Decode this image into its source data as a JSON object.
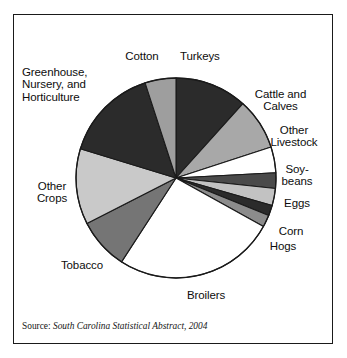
{
  "figure": {
    "source_label": "Source:",
    "source_title": "South Carolina Statistical Abstract, 2004"
  },
  "chart_data": {
    "type": "pie",
    "title": "",
    "subtitle": "",
    "xlabel": "",
    "ylabel": "",
    "legend_position": "none",
    "labels_position": "outside-callout",
    "grid": false,
    "start_angle_deg": 0,
    "direction": "clockwise",
    "categories": [
      "Turkeys",
      "Cattle and Calves",
      "Other Livestock",
      "Soybeans",
      "Eggs",
      "Corn",
      "Hogs",
      "Broilers",
      "Tobacco",
      "Other Crops",
      "Greenhouse, Nursery, and Horticulture",
      "Cotton"
    ],
    "values": [
      11.7,
      8.3,
      4.2,
      2.5,
      2.8,
      1.7,
      1.9,
      26.1,
      8.3,
      12.2,
      15.3,
      5.0
    ],
    "units": "percent of total agricultural receipts",
    "slices": [
      {
        "label": "Turkeys",
        "value": 11.7,
        "start_deg": 0,
        "end_deg": 42,
        "color": "#2b2b2b"
      },
      {
        "label": "Cattle and Calves",
        "value": 8.3,
        "start_deg": 42,
        "end_deg": 72,
        "color": "#a8a8a8"
      },
      {
        "label": "Other Livestock",
        "value": 4.2,
        "start_deg": 72,
        "end_deg": 87,
        "color": "#ffffff"
      },
      {
        "label": "Soybeans",
        "value": 2.5,
        "start_deg": 87,
        "end_deg": 96,
        "color": "#4a4a4a"
      },
      {
        "label": "Eggs",
        "value": 2.8,
        "start_deg": 96,
        "end_deg": 106,
        "color": "#c2c2c2"
      },
      {
        "label": "Corn",
        "value": 1.7,
        "start_deg": 106,
        "end_deg": 112,
        "color": "#2b2b2b"
      },
      {
        "label": "Hogs",
        "value": 1.9,
        "start_deg": 112,
        "end_deg": 119,
        "color": "#8c8c8c"
      },
      {
        "label": "Broilers",
        "value": 26.1,
        "start_deg": 119,
        "end_deg": 213,
        "color": "#ffffff"
      },
      {
        "label": "Tobacco",
        "value": 8.3,
        "start_deg": 213,
        "end_deg": 243,
        "color": "#757575"
      },
      {
        "label": "Other Crops",
        "value": 12.2,
        "start_deg": 243,
        "end_deg": 287,
        "color": "#c9c9c9"
      },
      {
        "label": "Greenhouse, Nursery, and Horticulture",
        "value": 15.3,
        "start_deg": 287,
        "end_deg": 342,
        "color": "#2b2b2b"
      },
      {
        "label": "Cotton",
        "value": 5.0,
        "start_deg": 342,
        "end_deg": 360,
        "color": "#9e9e9e"
      }
    ]
  },
  "labels": {
    "greenhouse_line1": "Greenhouse,",
    "greenhouse_line2": "Nursery, and",
    "greenhouse_line3": "Horticulture",
    "cotton": "Cotton",
    "turkeys": "Turkeys",
    "cattle_line1": "Cattle and",
    "cattle_line2": "Calves",
    "livestock_line1": "Other",
    "livestock_line2": "Livestock",
    "soybeans_line1": "Soy-",
    "soybeans_line2": "beans",
    "eggs": "Eggs",
    "corn": "Corn",
    "hogs": "Hogs",
    "broilers": "Broilers",
    "tobacco": "Tobacco",
    "othercrops_line1": "Other",
    "othercrops_line2": "Crops"
  },
  "colors": {
    "outline": "#1a1a1a",
    "text": "#0d0d0d",
    "background": "#ffffff"
  }
}
